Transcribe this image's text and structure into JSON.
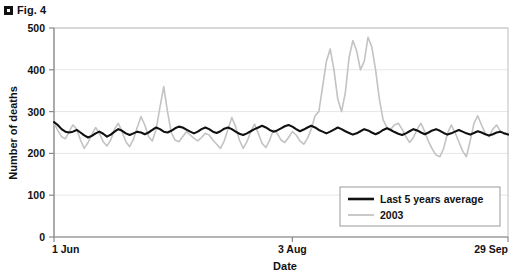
{
  "figure": {
    "bullet_icon": "square-bullet-icon",
    "caption": "Fig. 4"
  },
  "chart_data": {
    "type": "line",
    "title": "",
    "xlabel": "Date",
    "ylabel": "Number of deaths",
    "xlim": [
      0,
      120
    ],
    "ylim": [
      0,
      500
    ],
    "yticks": [
      0,
      100,
      200,
      300,
      400,
      500
    ],
    "ytick_labels": [
      "0",
      "100",
      "200",
      "300",
      "400",
      "500"
    ],
    "xticks": [
      0,
      63,
      120
    ],
    "xtick_labels": [
      "1 Jun",
      "3 Aug",
      "29 Sep"
    ],
    "grid": "horizontal",
    "grid_color": "#e6e6e6",
    "legend_position": "bottom-right",
    "series": [
      {
        "name": "Last 5 years average",
        "color": "#111111",
        "width": 2.1,
        "values": [
          275,
          268,
          258,
          252,
          250,
          252,
          256,
          250,
          243,
          238,
          242,
          248,
          252,
          247,
          240,
          245,
          252,
          258,
          254,
          248,
          244,
          248,
          252,
          250,
          246,
          250,
          256,
          262,
          258,
          252,
          250,
          254,
          260,
          264,
          262,
          257,
          252,
          248,
          252,
          258,
          262,
          258,
          252,
          249,
          253,
          259,
          262,
          258,
          252,
          247,
          244,
          248,
          253,
          258,
          262,
          266,
          262,
          256,
          252,
          255,
          260,
          265,
          268,
          264,
          258,
          253,
          257,
          262,
          266,
          262,
          256,
          252,
          248,
          252,
          257,
          262,
          258,
          253,
          249,
          245,
          248,
          253,
          258,
          255,
          250,
          246,
          250,
          256,
          260,
          256,
          251,
          247,
          244,
          248,
          253,
          258,
          255,
          250,
          246,
          250,
          255,
          258,
          254,
          249,
          245,
          248,
          252,
          256,
          252,
          248,
          245,
          249,
          253,
          250,
          246,
          243,
          246,
          250,
          252,
          248,
          245
        ]
      },
      {
        "name": "2003",
        "color": "#c3c3c3",
        "width": 1.6,
        "values": [
          273,
          255,
          240,
          235,
          252,
          268,
          258,
          232,
          212,
          226,
          245,
          262,
          248,
          228,
          218,
          232,
          258,
          272,
          252,
          228,
          216,
          234,
          262,
          288,
          268,
          240,
          230,
          258,
          310,
          360,
          300,
          250,
          232,
          228,
          240,
          252,
          244,
          236,
          230,
          238,
          248,
          244,
          232,
          222,
          212,
          230,
          258,
          286,
          264,
          232,
          212,
          228,
          252,
          270,
          248,
          224,
          214,
          232,
          256,
          248,
          232,
          226,
          238,
          252,
          244,
          230,
          222,
          236,
          258,
          290,
          300,
          360,
          420,
          450,
          400,
          330,
          300,
          345,
          430,
          470,
          445,
          400,
          420,
          478,
          455,
          400,
          330,
          280,
          262,
          258,
          268,
          272,
          258,
          240,
          226,
          238,
          258,
          272,
          252,
          228,
          210,
          196,
          192,
          212,
          248,
          268,
          250,
          228,
          206,
          192,
          230,
          272,
          290,
          268,
          248,
          240,
          258,
          268,
          252,
          246,
          248
        ]
      }
    ]
  },
  "legend": {
    "items": [
      {
        "label": "Last 5 years average",
        "color": "#111111",
        "swatch": "thick-line-swatch"
      },
      {
        "label": "2003",
        "color": "#c3c3c3",
        "swatch": "thin-line-swatch"
      }
    ]
  }
}
